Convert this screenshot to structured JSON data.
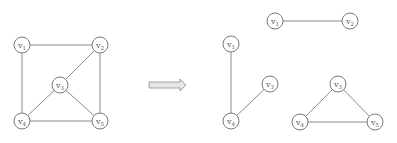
{
  "diagram": {
    "node_radius": 8,
    "colors": {
      "edge": "#8a8a8a",
      "node_stroke": "#7a7a7a",
      "label": "#555555",
      "arrow_fill": "#e6e6e6"
    },
    "original_graph": {
      "nodes": [
        {
          "id": "v1",
          "base": "v",
          "sub": "1",
          "x": 22,
          "y": 45
        },
        {
          "id": "v2",
          "base": "v",
          "sub": "2",
          "x": 100,
          "y": 45
        },
        {
          "id": "v3",
          "base": "v",
          "sub": "3",
          "x": 60,
          "y": 85
        },
        {
          "id": "v4",
          "base": "v",
          "sub": "4",
          "x": 22,
          "y": 121
        },
        {
          "id": "v5",
          "base": "v",
          "sub": "5",
          "x": 100,
          "y": 121
        }
      ],
      "edges": [
        [
          "v1",
          "v2"
        ],
        [
          "v1",
          "v4"
        ],
        [
          "v2",
          "v3"
        ],
        [
          "v2",
          "v5"
        ],
        [
          "v3",
          "v4"
        ],
        [
          "v3",
          "v5"
        ],
        [
          "v4",
          "v5"
        ]
      ]
    },
    "arrow": {
      "x1": 149,
      "x2": 186,
      "y": 85,
      "direction": "right"
    },
    "result_graphs": [
      {
        "name": "component-v1-v2",
        "nodes": [
          {
            "id": "v1",
            "base": "v",
            "sub": "1",
            "x": 275,
            "y": 21
          },
          {
            "id": "v2",
            "base": "v",
            "sub": "2",
            "x": 350,
            "y": 21
          }
        ],
        "edges": [
          [
            "v1",
            "v2"
          ]
        ]
      },
      {
        "name": "component-v1-v4-v3",
        "nodes": [
          {
            "id": "v1",
            "base": "v",
            "sub": "1",
            "x": 231,
            "y": 44
          },
          {
            "id": "v3",
            "base": "v",
            "sub": "3",
            "x": 270,
            "y": 84
          },
          {
            "id": "v4",
            "base": "v",
            "sub": "4",
            "x": 231,
            "y": 121
          }
        ],
        "edges": [
          [
            "v1",
            "v4"
          ],
          [
            "v4",
            "v3"
          ]
        ]
      },
      {
        "name": "component-triangle-v3-v4-v5",
        "nodes": [
          {
            "id": "v3",
            "base": "v",
            "sub": "3",
            "x": 338,
            "y": 84
          },
          {
            "id": "v4",
            "base": "v",
            "sub": "4",
            "x": 300,
            "y": 122
          },
          {
            "id": "v5",
            "base": "v",
            "sub": "5",
            "x": 375,
            "y": 122
          }
        ],
        "edges": [
          [
            "v3",
            "v4"
          ],
          [
            "v3",
            "v5"
          ],
          [
            "v4",
            "v5"
          ]
        ]
      }
    ]
  }
}
